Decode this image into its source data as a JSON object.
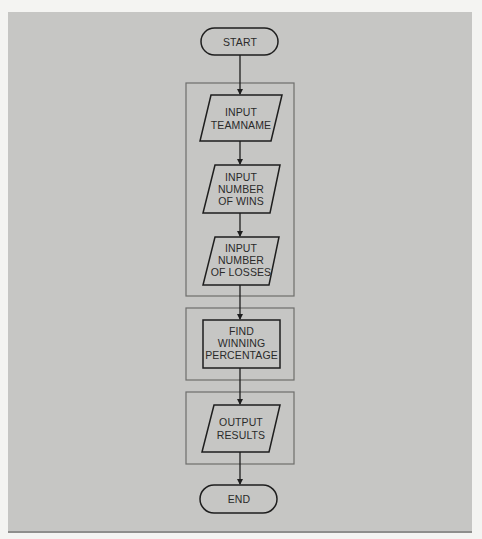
{
  "diagram": {
    "type": "flowchart",
    "nodes": {
      "start": {
        "shape": "terminator",
        "label": "START"
      },
      "input_teamname": {
        "shape": "parallelogram",
        "lines": [
          "INPUT",
          "TEAMNAME"
        ]
      },
      "input_wins": {
        "shape": "parallelogram",
        "lines": [
          "INPUT",
          "NUMBER",
          "OF WINS"
        ]
      },
      "input_losses": {
        "shape": "parallelogram",
        "lines": [
          "INPUT",
          "NUMBER",
          "OF LOSSES"
        ]
      },
      "find_pct": {
        "shape": "process",
        "lines": [
          "FIND",
          "WINNING",
          "PERCENTAGE"
        ]
      },
      "output_results": {
        "shape": "parallelogram",
        "lines": [
          "OUTPUT",
          "RESULTS"
        ]
      },
      "end": {
        "shape": "terminator",
        "label": "END"
      }
    },
    "groups": [
      {
        "name": "input-group",
        "contains": [
          "input_teamname",
          "input_wins",
          "input_losses"
        ]
      },
      {
        "name": "process-group",
        "contains": [
          "find_pct"
        ]
      },
      {
        "name": "output-group",
        "contains": [
          "output_results"
        ]
      }
    ],
    "edges": [
      [
        "start",
        "input_teamname"
      ],
      [
        "input_teamname",
        "input_wins"
      ],
      [
        "input_wins",
        "input_losses"
      ],
      [
        "input_losses",
        "find_pct"
      ],
      [
        "find_pct",
        "output_results"
      ],
      [
        "output_results",
        "end"
      ]
    ],
    "colors": {
      "background": "#c6c6c4",
      "stroke": "#1e1e1e",
      "group_stroke": "#6e6e6c",
      "text": "#2a2a2a"
    }
  }
}
